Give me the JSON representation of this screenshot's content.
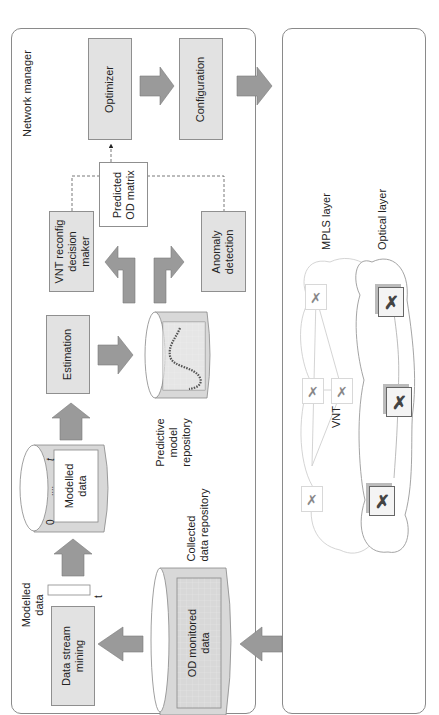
{
  "figure": {
    "orientation": "rotated 90 degrees counter-clockwise",
    "colors": {
      "box_fill": "#e2e2e2",
      "arrow_fill": "#9a9a9a",
      "border": "#8a8a8a",
      "cloud_line": "#c8c8c8"
    }
  },
  "network_manager": {
    "title": "Network manager",
    "optimizer": "Optimizer",
    "configuration": "Configuration",
    "predicted_od_matrix": {
      "line1": "Predicted",
      "line2": "OD matrix"
    },
    "vnt_reconfig": {
      "line1": "VNT reconfig",
      "line2": "decision",
      "line3": "maker"
    },
    "anomaly_detection": {
      "line1": "Anomaly",
      "line2": "detection"
    },
    "estimation": "Estimation",
    "predictive_repo": {
      "line1": "Predictive",
      "line2": "model",
      "line3": "repository"
    },
    "modelled_data_repo": {
      "label_line1": "Modelled",
      "label_line2": "data",
      "axis_start": "0",
      "axis_dots": "....",
      "axis_end": "t"
    },
    "data_stream_mining": {
      "line1": "Data stream",
      "line2": "mining"
    },
    "modelled_data_output": {
      "line1": "Modelled",
      "line2": "data",
      "t_label": "t"
    },
    "collected_repo": {
      "title_line1": "Collected",
      "title_line2": "data repository",
      "content_line1": "OD monitored",
      "content_line2": "data"
    }
  },
  "network": {
    "mpls_layer": "MPLS layer",
    "optical_layer": "Optical layer",
    "vnt_label": "VNT",
    "mpls_nodes": 4,
    "optical_nodes": 4
  }
}
